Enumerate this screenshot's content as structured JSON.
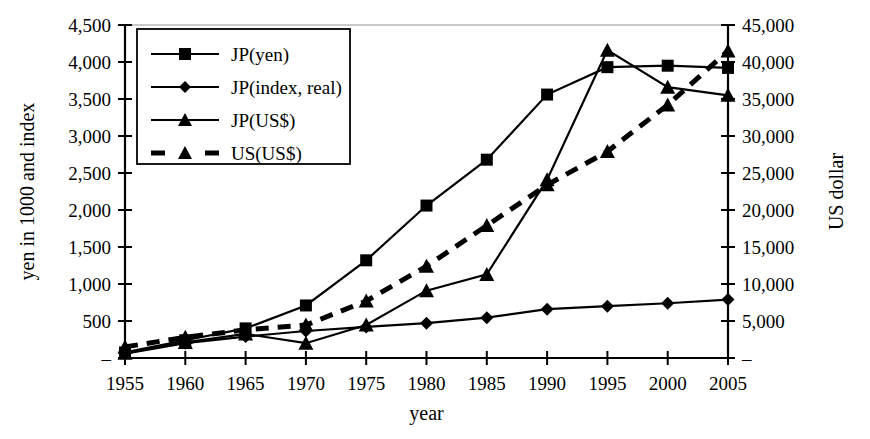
{
  "chart_data": {
    "type": "line",
    "title": "",
    "xlabel": "year",
    "ylabel": "yen in 1000 and index",
    "y2label": "US dollar",
    "x": [
      1955,
      1960,
      1965,
      1970,
      1975,
      1980,
      1985,
      1990,
      1995,
      2000,
      2005
    ],
    "categories": [
      "1955",
      "1960",
      "1965",
      "1970",
      "1975",
      "1980",
      "1985",
      "1990",
      "1995",
      "2000",
      "2005"
    ],
    "xtick_labels": [
      "1955",
      "1960",
      "1965",
      "1970",
      "1975",
      "1980",
      "1985",
      "1990",
      "1995",
      "2000",
      "2005"
    ],
    "ylim": [
      0,
      4500
    ],
    "ytick_values": [
      0,
      500,
      1000,
      1500,
      2000,
      2500,
      3000,
      3500,
      4000,
      4500
    ],
    "ytick_labels": [
      "–",
      "500",
      "1,000",
      "1,500",
      "2,000",
      "2,500",
      "3,000",
      "3,500",
      "4,000",
      "4,500"
    ],
    "y2lim": [
      0,
      45000
    ],
    "y2tick_values": [
      0,
      5000,
      10000,
      15000,
      20000,
      25000,
      30000,
      35000,
      40000,
      45000
    ],
    "y2tick_labels": [
      "–",
      "5,000",
      "10,000",
      "15,000",
      "20,000",
      "25,000",
      "30,000",
      "35,000",
      "40,000",
      "45,000"
    ],
    "grid": false,
    "legend_position": "upper-left",
    "series": [
      {
        "name": "JP(yen)",
        "axis": "left",
        "marker": "square",
        "line": "solid",
        "color": "#000000",
        "values": [
          75,
          240,
          400,
          710,
          1320,
          2060,
          2680,
          3560,
          3930,
          3950,
          3920
        ]
      },
      {
        "name": "JP(index, real)",
        "axis": "left",
        "marker": "diamond",
        "line": "solid",
        "color": "#000000",
        "values": [
          60,
          200,
          290,
          365,
          420,
          470,
          545,
          660,
          700,
          740,
          790
        ]
      },
      {
        "name": "JP(US$)",
        "axis": "right",
        "marker": "triangle",
        "line": "solid",
        "color": "#000000",
        "values": [
          650,
          2100,
          3250,
          2000,
          4450,
          9100,
          11300,
          24100,
          41600,
          36600,
          35500
        ]
      },
      {
        "name": "US(US$)",
        "axis": "right",
        "marker": "triangle",
        "line": "dashed",
        "color": "#000000",
        "values": [
          1500,
          2800,
          3800,
          4450,
          7700,
          12400,
          17900,
          23400,
          27900,
          34200,
          41500
        ]
      }
    ]
  },
  "legend": {
    "items": [
      {
        "label": "JP(yen)",
        "marker": "square",
        "line": "solid"
      },
      {
        "label": "JP(index, real)",
        "marker": "diamond",
        "line": "solid"
      },
      {
        "label": "JP(US$)",
        "marker": "triangle",
        "line": "solid"
      },
      {
        "label": "US(US$)",
        "marker": "triangle",
        "line": "dashed"
      }
    ]
  }
}
